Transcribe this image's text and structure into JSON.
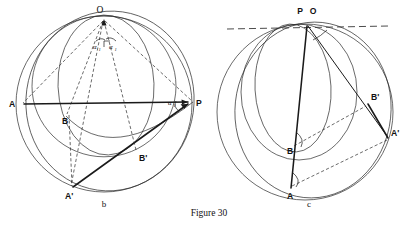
{
  "figure": {
    "caption": "Figure 30",
    "panels": [
      {
        "id": "b",
        "sublabel": "b"
      },
      {
        "id": "c",
        "sublabel": "c"
      }
    ]
  },
  "panel_b": {
    "sublabel": "b",
    "points": [
      {
        "name": "O",
        "label": "O",
        "x": 104,
        "y": 16
      },
      {
        "name": "A",
        "label": "A",
        "x": 18,
        "y": 104
      },
      {
        "name": "B",
        "label": "B",
        "x": 66,
        "y": 116
      },
      {
        "name": "P",
        "label": "P",
        "x": 193,
        "y": 102
      },
      {
        "name": "Bp",
        "label": "B'",
        "x": 136,
        "y": 152
      },
      {
        "name": "Ap",
        "label": "A'",
        "x": 70,
        "y": 189
      }
    ],
    "angle_labels": [
      {
        "name": "alpha-at-O-left",
        "base": "α",
        "sub": "1"
      },
      {
        "name": "alpha-at-O-right",
        "base": "α",
        "sub": "1"
      },
      {
        "name": "alpha-at-P",
        "base": "α",
        "sub": "1"
      }
    ]
  },
  "panel_c": {
    "sublabel": "c",
    "points": [
      {
        "name": "P",
        "label": "P",
        "x": 305,
        "y": 17
      },
      {
        "name": "O",
        "label": "O",
        "x": 317,
        "y": 17
      },
      {
        "name": "Bp",
        "label": "B'",
        "x": 368,
        "y": 106
      },
      {
        "name": "Ap",
        "label": "A'",
        "x": 390,
        "y": 142
      },
      {
        "name": "B",
        "label": "B",
        "x": 295,
        "y": 148
      },
      {
        "name": "A",
        "label": "A",
        "x": 291,
        "y": 196
      }
    ]
  },
  "colors": {
    "ink": "#1a1a1a",
    "curve": "#2b2b2b",
    "background": "#ffffff"
  }
}
